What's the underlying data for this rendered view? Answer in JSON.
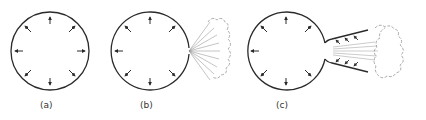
{
  "figure": {
    "panels": [
      {
        "id": "a",
        "label": "(a)",
        "description": "Closed sphere with pressure arrows pointing outward in all directions (balanced)"
      },
      {
        "id": "b",
        "label": "(b)",
        "description": "Sphere with a hole; gas escapes as a plume out the right side"
      },
      {
        "id": "c",
        "label": "(c)",
        "description": "Sphere with a nozzle; gas jet expands through the flared nozzle, pressure arrows on nozzle walls"
      }
    ],
    "colors": {
      "line": "#2a2a2a",
      "plume": "#888888"
    }
  }
}
